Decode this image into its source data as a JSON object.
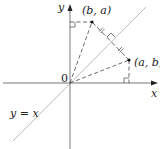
{
  "diagram": {
    "labels": {
      "y_axis": "y",
      "x_axis": "x",
      "origin": "0",
      "point_ba": "(b, a)",
      "point_ab": "(a, b)",
      "line": "y = x"
    },
    "colors": {
      "axis": "#555555",
      "diagonal": "#bbbbbb",
      "dashed": "#444444",
      "point": "#111111"
    },
    "points": {
      "origin": [
        70,
        83
      ],
      "ba": [
        92,
        22
      ],
      "ab": [
        129,
        60
      ]
    }
  }
}
